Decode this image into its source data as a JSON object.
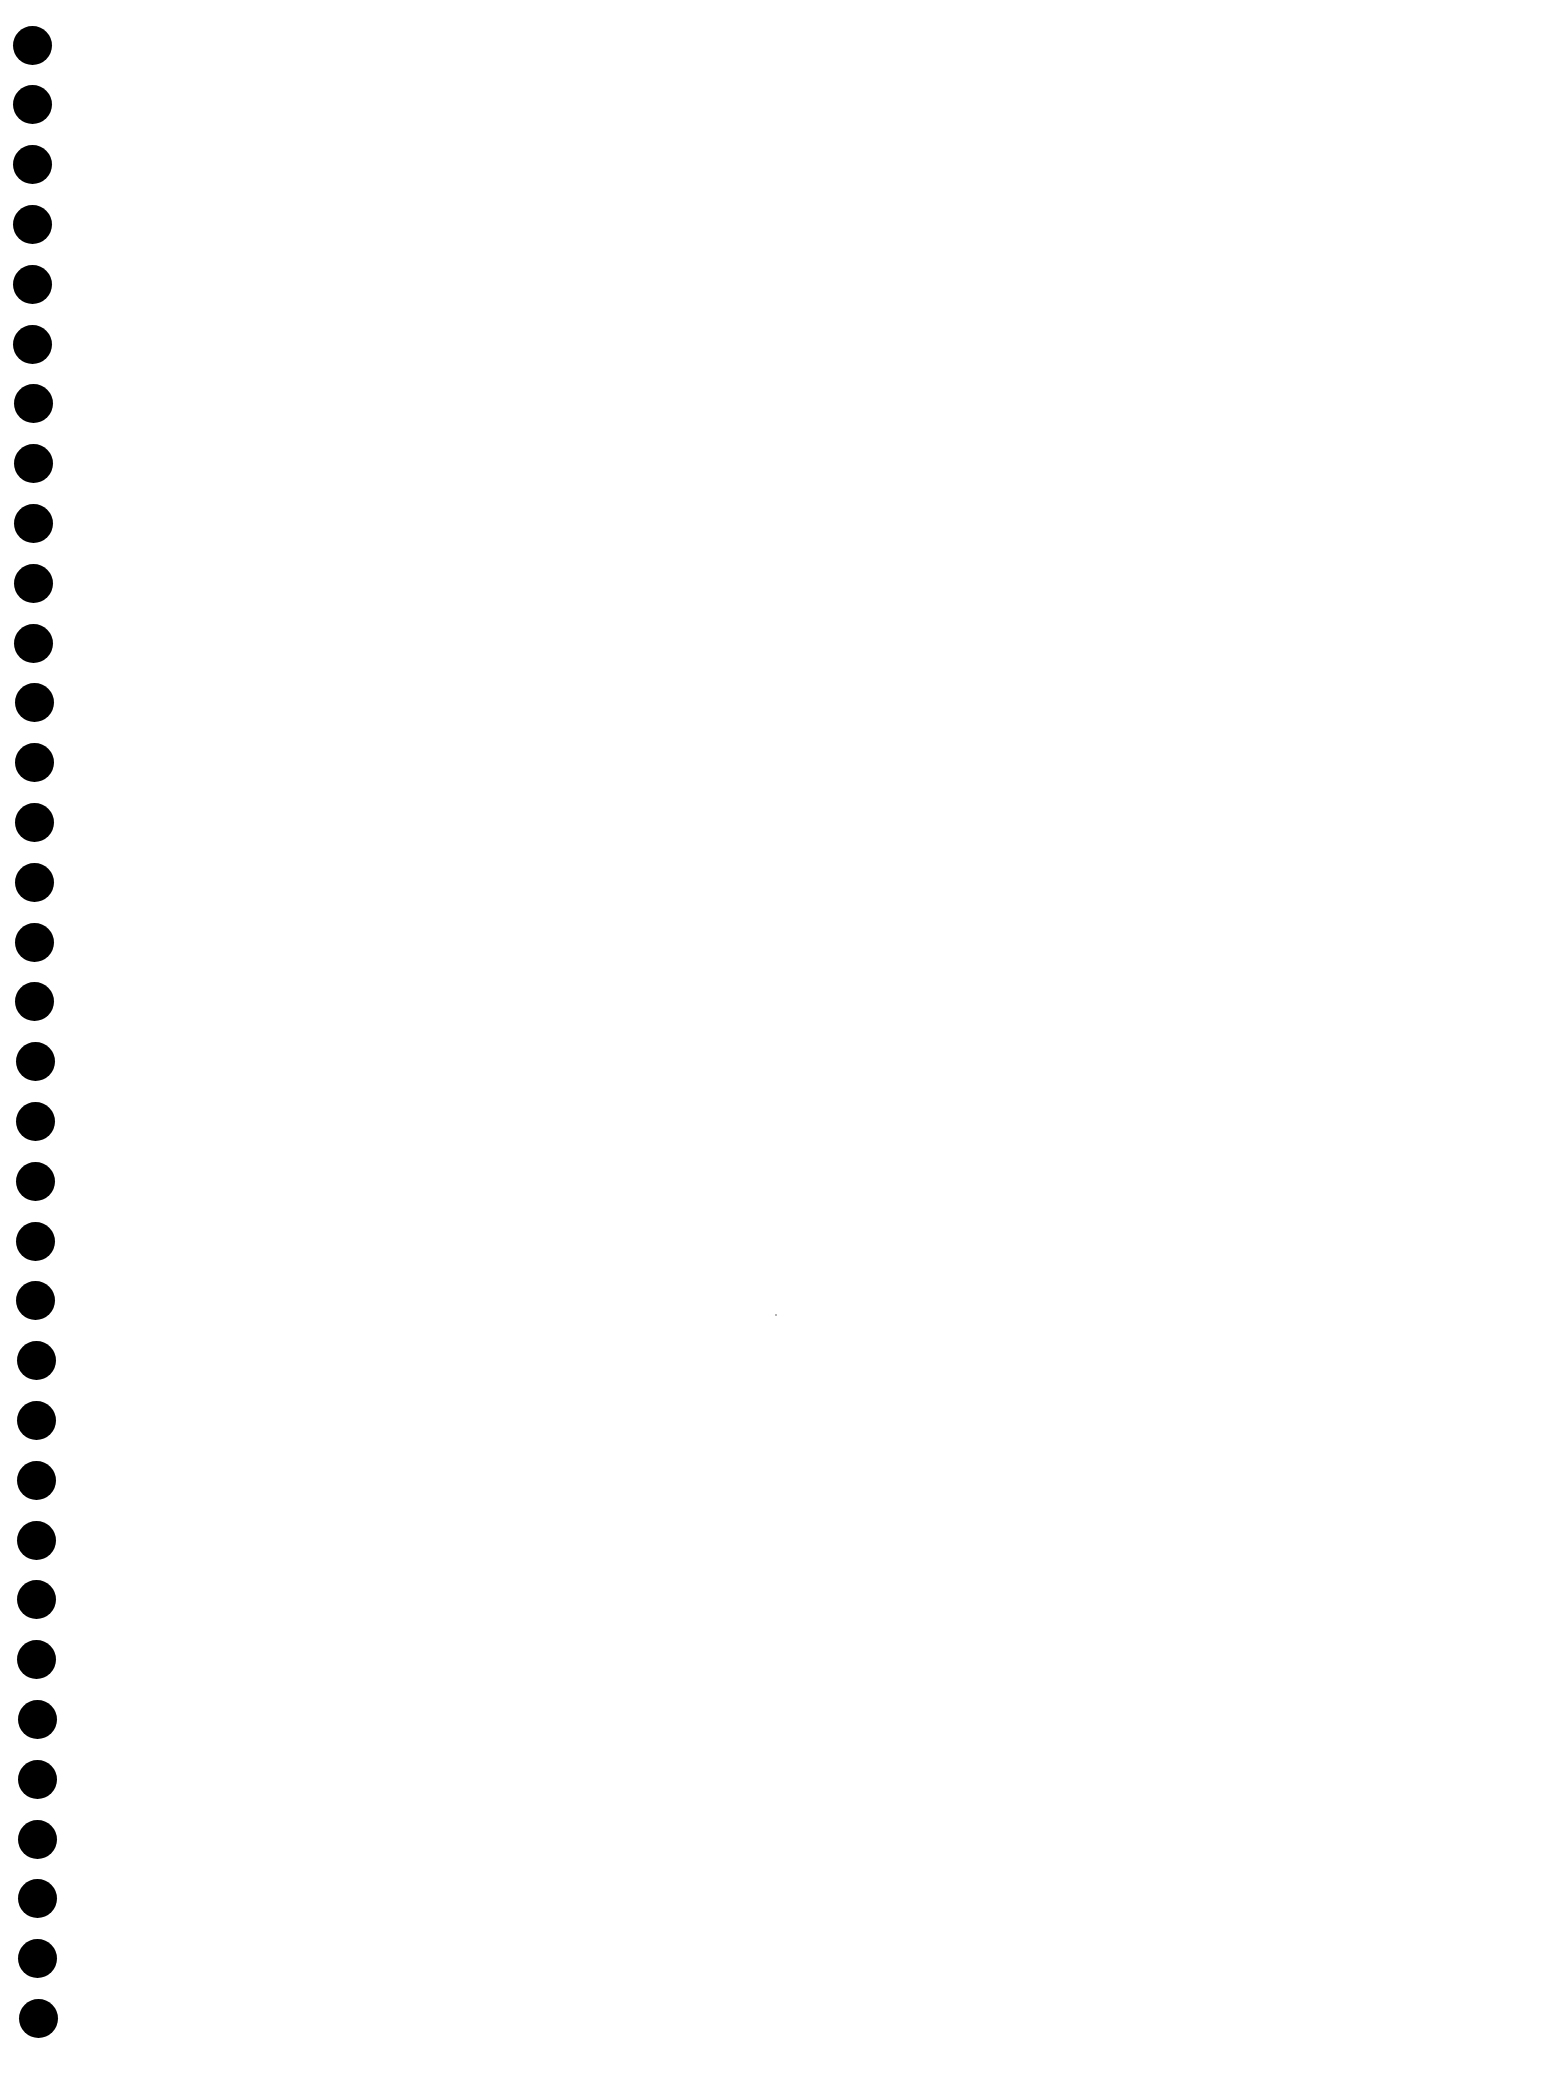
{
  "page": {
    "background": "#ffffff"
  },
  "binder_holes": {
    "count": 34,
    "color": "#000000",
    "first_center_y": 45,
    "spacing_px": 59.8,
    "diameter_px": 39,
    "center_x_start": 32,
    "center_x_end": 38
  },
  "marks": [
    {
      "type": "speck",
      "x": 775,
      "y": 1314,
      "color": "#9a9a9a"
    }
  ]
}
